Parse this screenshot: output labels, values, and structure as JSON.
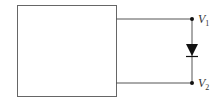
{
  "diagram": {
    "type": "circuit",
    "components": [
      {
        "id": "box",
        "kind": "black-box",
        "label": ""
      },
      {
        "id": "diode",
        "kind": "diode",
        "orientation": "cathode-down"
      }
    ],
    "nodes": {
      "v1": {
        "label": "V",
        "subscript": "1"
      },
      "v2": {
        "label": "V",
        "subscript": "2"
      }
    },
    "colors": {
      "line": "#555555",
      "fill": "#111111",
      "background": "#ffffff"
    }
  }
}
